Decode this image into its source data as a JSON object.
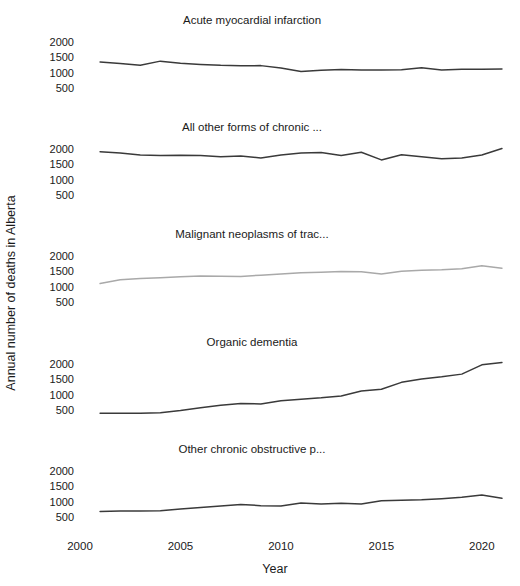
{
  "figure": {
    "width": 520,
    "height": 586,
    "background": "#ffffff",
    "line_color_dark": "#3a3a3a",
    "line_color_light": "#a9a9a9"
  },
  "axes": {
    "y_title": "Annual number of deaths in Alberta",
    "x_title": "Year",
    "y_ticks": [
      "2000",
      "1500",
      "1000",
      "500"
    ],
    "y_tick_values": [
      2000,
      1500,
      1000,
      500
    ],
    "x_ticks": [
      "2000",
      "2005",
      "2010",
      "2015",
      "2020"
    ],
    "x_tick_values": [
      2000,
      2005,
      2010,
      2015,
      2020
    ],
    "ylim": [
      250,
      2250
    ],
    "xlim": [
      2000,
      2021.6
    ]
  },
  "chart_data": {
    "type": "line",
    "title": "",
    "subtitle": "",
    "xlabel": "Year",
    "ylabel": "Annual number of deaths in Alberta",
    "layout": "faceted vertical small multiples, 5 panels, shared x axis",
    "grid": false,
    "legend": "none",
    "xlim": [
      2000,
      2021.6
    ],
    "ylim": [
      250,
      2250
    ],
    "x": [
      2001,
      2002,
      2003,
      2004,
      2005,
      2006,
      2007,
      2008,
      2009,
      2010,
      2011,
      2012,
      2013,
      2014,
      2015,
      2016,
      2017,
      2018,
      2019,
      2020,
      2021
    ],
    "panels": [
      {
        "title": "Acute myocardial infarction",
        "color": "#3a3a3a",
        "values": [
          1345,
          1300,
          1245,
          1375,
          1310,
          1270,
          1240,
          1225,
          1165,
          1090,
          1035,
          1080,
          1105,
          1090,
          1085,
          1100,
          1155,
          1090,
          1110,
          1110,
          1125
        ]
      },
      {
        "title": "All other forms of chronic ...",
        "color": "#3a3a3a",
        "values": [
          1905,
          1855,
          1790,
          1780,
          1790,
          1785,
          1740,
          1695,
          1780,
          1855,
          1880,
          1775,
          1885,
          1635,
          1805,
          1745,
          1680,
          1690,
          1790,
          1930,
          2010
        ]
      },
      {
        "title": "Malignant neoplasms of trac...",
        "color": "#a9a9a9",
        "values": [
          1105,
          1225,
          1270,
          1290,
          1320,
          1345,
          1330,
          1375,
          1405,
          1450,
          1460,
          1485,
          1490,
          1410,
          1495,
          1530,
          1545,
          1580,
          1670,
          1595,
          1620
        ]
      },
      {
        "title": "Organic dementia",
        "color": "#3a3a3a",
        "values": [
          405,
          405,
          405,
          420,
          480,
          570,
          650,
          715,
          705,
          805,
          855,
          895,
          960,
          1110,
          1175,
          1400,
          1505,
          1575,
          1655,
          1960,
          2030,
          2130
        ]
      },
      {
        "title": "Other chronic obstructive p...",
        "color": "#3a3a3a",
        "values": [
          685,
          700,
          710,
          710,
          725,
          775,
          820,
          855,
          900,
          870,
          855,
          935,
          1005,
          985,
          1000,
          985,
          1065,
          1100,
          1125,
          1145,
          1195,
          1250,
          1105
        ]
      }
    ]
  },
  "panel_series": [
    {
      "name": "acute-myocardial-infarction",
      "title": "Acute myocardial infarction",
      "color": "#3a3a3a",
      "points": [
        [
          2001,
          1345
        ],
        [
          2002,
          1300
        ],
        [
          2003,
          1245
        ],
        [
          2004,
          1375
        ],
        [
          2005,
          1310
        ],
        [
          2006,
          1270
        ],
        [
          2007,
          1240
        ],
        [
          2008,
          1225
        ],
        [
          2009,
          1230
        ],
        [
          2010,
          1150
        ],
        [
          2011,
          1040
        ],
        [
          2012,
          1080
        ],
        [
          2013,
          1105
        ],
        [
          2014,
          1090
        ],
        [
          2015,
          1085
        ],
        [
          2016,
          1100
        ],
        [
          2017,
          1160
        ],
        [
          2018,
          1090
        ],
        [
          2019,
          1110
        ],
        [
          2020,
          1110
        ],
        [
          2021,
          1125
        ]
      ]
    },
    {
      "name": "all-other-forms-of-chronic",
      "title": "All other forms of chronic ...",
      "color": "#3a3a3a",
      "points": [
        [
          2001,
          1905
        ],
        [
          2002,
          1860
        ],
        [
          2003,
          1795
        ],
        [
          2004,
          1780
        ],
        [
          2005,
          1790
        ],
        [
          2006,
          1785
        ],
        [
          2007,
          1745
        ],
        [
          2008,
          1770
        ],
        [
          2009,
          1700
        ],
        [
          2010,
          1800
        ],
        [
          2011,
          1865
        ],
        [
          2012,
          1880
        ],
        [
          2013,
          1780
        ],
        [
          2014,
          1885
        ],
        [
          2015,
          1640
        ],
        [
          2016,
          1805
        ],
        [
          2017,
          1745
        ],
        [
          2018,
          1680
        ],
        [
          2019,
          1700
        ],
        [
          2020,
          1800
        ],
        [
          2021,
          2010
        ]
      ]
    },
    {
      "name": "malignant-neoplasms-of-trac",
      "title": "Malignant neoplasms of trac...",
      "color": "#a9a9a9",
      "points": [
        [
          2001,
          1105
        ],
        [
          2002,
          1225
        ],
        [
          2003,
          1270
        ],
        [
          2004,
          1290
        ],
        [
          2005,
          1320
        ],
        [
          2006,
          1345
        ],
        [
          2007,
          1335
        ],
        [
          2008,
          1330
        ],
        [
          2009,
          1375
        ],
        [
          2010,
          1410
        ],
        [
          2011,
          1450
        ],
        [
          2012,
          1465
        ],
        [
          2013,
          1490
        ],
        [
          2014,
          1485
        ],
        [
          2015,
          1410
        ],
        [
          2016,
          1500
        ],
        [
          2017,
          1530
        ],
        [
          2018,
          1545
        ],
        [
          2019,
          1580
        ],
        [
          2020,
          1675
        ],
        [
          2021,
          1600
        ]
      ]
    },
    {
      "name": "organic-dementia",
      "title": "Organic dementia",
      "color": "#3a3a3a",
      "points": [
        [
          2001,
          405
        ],
        [
          2002,
          405
        ],
        [
          2003,
          405
        ],
        [
          2004,
          420
        ],
        [
          2005,
          490
        ],
        [
          2006,
          580
        ],
        [
          2007,
          660
        ],
        [
          2008,
          715
        ],
        [
          2009,
          705
        ],
        [
          2010,
          810
        ],
        [
          2011,
          855
        ],
        [
          2012,
          900
        ],
        [
          2013,
          960
        ],
        [
          2014,
          1120
        ],
        [
          2015,
          1180
        ],
        [
          2016,
          1400
        ],
        [
          2017,
          1510
        ],
        [
          2018,
          1580
        ],
        [
          2019,
          1665
        ],
        [
          2020,
          1965
        ],
        [
          2021,
          2040
        ]
      ]
    },
    {
      "name": "other-chronic-obstructive-p",
      "title": "Other chronic obstructive p...",
      "color": "#3a3a3a",
      "points": [
        [
          2001,
          685
        ],
        [
          2002,
          700
        ],
        [
          2003,
          705
        ],
        [
          2004,
          710
        ],
        [
          2005,
          770
        ],
        [
          2006,
          815
        ],
        [
          2007,
          860
        ],
        [
          2008,
          910
        ],
        [
          2009,
          875
        ],
        [
          2010,
          860
        ],
        [
          2011,
          960
        ],
        [
          2012,
          930
        ],
        [
          2013,
          950
        ],
        [
          2014,
          925
        ],
        [
          2015,
          1035
        ],
        [
          2016,
          1045
        ],
        [
          2017,
          1065
        ],
        [
          2018,
          1100
        ],
        [
          2019,
          1145
        ],
        [
          2020,
          1215
        ],
        [
          2021,
          1110
        ]
      ]
    }
  ]
}
